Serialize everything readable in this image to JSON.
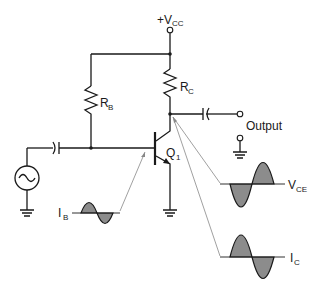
{
  "diagram": {
    "type": "common-emitter transistor amplifier",
    "labels": {
      "vcc_main": "+V",
      "vcc_sub": "CC",
      "rb_main": "R",
      "rb_sub": "B",
      "rc_main": "R",
      "rc_sub": "C",
      "q_main": "Q",
      "q_sub": "1",
      "output": "Output",
      "ib_main": "I",
      "ib_sub": "B",
      "vce_main": "V",
      "vce_sub": "CE",
      "ic_main": "I",
      "ic_sub": "C"
    },
    "components": [
      {
        "id": "vcc",
        "kind": "supply-terminal"
      },
      {
        "id": "RB",
        "kind": "resistor"
      },
      {
        "id": "RC",
        "kind": "resistor"
      },
      {
        "id": "Q1",
        "kind": "npn-transistor"
      },
      {
        "id": "Cin",
        "kind": "capacitor"
      },
      {
        "id": "Cout",
        "kind": "capacitor"
      },
      {
        "id": "source",
        "kind": "ac-source"
      },
      {
        "id": "output",
        "kind": "output-terminal"
      }
    ],
    "waveforms": [
      {
        "name": "IB",
        "phase": "in-phase"
      },
      {
        "name": "VCE",
        "phase": "inverted"
      },
      {
        "name": "IC",
        "phase": "in-phase"
      }
    ],
    "colors": {
      "line": "#1a1a1a",
      "waveform_fill": "#8c8c8c",
      "pointer": "#888888"
    }
  }
}
